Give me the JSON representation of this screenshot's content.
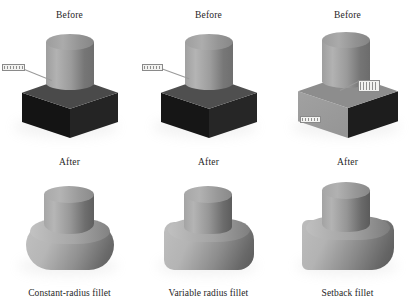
{
  "figure": {
    "background_color": "#ffffff",
    "ink_color": "#262626"
  },
  "columns": [
    {
      "id": "constant-radius",
      "before_heading": "Before",
      "after_heading": "After",
      "caption": "Constant-radius fillet",
      "before": {
        "box_top_color": "#4a4a4a",
        "box_left_color": "#141414",
        "box_right_color": "#242424",
        "cylinder_light_color": "#b2b2b2",
        "cylinder_dark_color": "#6e6e6e",
        "callouts": [
          {
            "name": "edge-selection-callout",
            "label": ""
          }
        ]
      },
      "after": {
        "body_light_color": "#b6b6b6",
        "body_dark_color": "#5d5d5d",
        "fillet_style": "large uniform rounding on all edges"
      }
    },
    {
      "id": "variable-radius",
      "before_heading": "Before",
      "after_heading": "After",
      "caption": "Variable radius fillet",
      "before": {
        "box_top_color": "#4f4f4f",
        "box_left_color": "#161616",
        "box_right_color": "#262626",
        "cylinder_light_color": "#b4b4b4",
        "cylinder_dark_color": "#6f6f6f",
        "callouts": [
          {
            "name": "edge-selection-callout",
            "label": ""
          }
        ]
      },
      "after": {
        "body_light_color": "#b4b4b4",
        "body_dark_color": "#5a5a5a",
        "fillet_style": "rounding that varies along the edge"
      }
    },
    {
      "id": "setback",
      "before_heading": "Before",
      "after_heading": "After",
      "caption": "Setback fillet",
      "before": {
        "box_top_color": "#8d8d8d",
        "box_left_color": "#9a9a9a",
        "box_right_color": "#1d1d1d",
        "cylinder_light_color": "#b2b2b2",
        "cylinder_dark_color": "#6c6c6c",
        "callouts": [
          {
            "name": "vertex-setback-callout",
            "label": ""
          },
          {
            "name": "edge-setback-callout",
            "label": ""
          }
        ]
      },
      "after": {
        "body_light_color": "#b3b3b3",
        "body_dark_color": "#585858",
        "fillet_style": "blended setback at the corner vertex"
      }
    }
  ]
}
